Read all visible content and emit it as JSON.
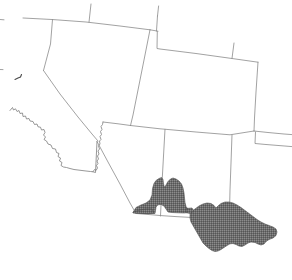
{
  "map": {
    "title": "Southwestern United States and Northern Mexico Outline Map",
    "background_color": "#ffffff",
    "boundary_color": "#8a8a8a",
    "coastline_color": "#7d7d7d",
    "highlight_fill_color": "#707070",
    "highlight_pattern": "stipple-dither",
    "projection_note": "tilted / rotated frame, boundaries slope downward to the right",
    "regions": [
      {
        "id": "nevada",
        "name": "Nevada",
        "shaded": false,
        "label": ""
      },
      {
        "id": "california",
        "name": "California",
        "shaded": false,
        "label": ""
      },
      {
        "id": "utah",
        "name": "Utah",
        "shaded": false,
        "label": ""
      },
      {
        "id": "arizona",
        "name": "Arizona",
        "shaded": false,
        "label": ""
      },
      {
        "id": "colorado",
        "name": "Colorado",
        "shaded": false,
        "label": ""
      },
      {
        "id": "new-mexico",
        "name": "New Mexico",
        "shaded": false,
        "label": ""
      },
      {
        "id": "idaho-oregon-stub",
        "name": "Northern state stub",
        "shaded": false,
        "label": ""
      },
      {
        "id": "wyoming-stub",
        "name": "Wyoming stub",
        "shaded": false,
        "label": ""
      },
      {
        "id": "texas-stub",
        "name": "Texas stub",
        "shaded": false,
        "label": ""
      }
    ],
    "highlight": {
      "name": "Shaded distribution area",
      "description": "Stippled gray area covering southeastern Arizona, southwestern New Mexico and adjacent northern Mexico",
      "shaded": true,
      "fill": "#707070"
    },
    "features": {
      "islet_name": "coastal-islet",
      "coastline_name": "pacific-coastline",
      "border_name": "us-mexico-border"
    },
    "legend": {
      "present": false,
      "entries": []
    },
    "axes": {
      "present": false
    },
    "labels": []
  }
}
